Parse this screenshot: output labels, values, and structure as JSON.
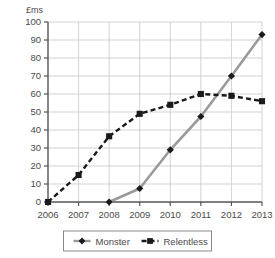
{
  "chart_data": {
    "type": "line",
    "title": "",
    "subtitle": "",
    "xlabel": "",
    "ylabel": "£ms",
    "ylabel_position": "top-left",
    "categories": [
      "2006",
      "2007",
      "2008",
      "2009",
      "2010",
      "2011",
      "2012",
      "2013"
    ],
    "x": [
      2006,
      2007,
      2008,
      2009,
      2010,
      2011,
      2012,
      2013
    ],
    "xlim": [
      2006,
      2013
    ],
    "ylim": [
      0,
      100
    ],
    "ytick_step": 10,
    "yticks": [
      0,
      10,
      20,
      30,
      40,
      50,
      60,
      70,
      80,
      90,
      100
    ],
    "ytick_labels": [
      "0",
      "10",
      "20",
      "30",
      "40",
      "50",
      "60",
      "70",
      "80",
      "90",
      "100"
    ],
    "grid": {
      "horizontal": true,
      "vertical": true,
      "color": "#c8c8c8"
    },
    "legend": {
      "position": "bottom",
      "boxed": true
    },
    "series": [
      {
        "name": "Monster",
        "marker": "diamond",
        "line_style": "solid",
        "color": "#9a9a9a",
        "marker_color": "#1a1a1a",
        "x": [
          2008,
          2009,
          2010,
          2011,
          2012,
          2013
        ],
        "values": [
          0,
          7.5,
          29,
          47.5,
          70,
          93
        ]
      },
      {
        "name": "Relentless",
        "marker": "square",
        "line_style": "dashed",
        "color": "#1a1a1a",
        "marker_color": "#1a1a1a",
        "x": [
          2006,
          2007,
          2008,
          2009,
          2010,
          2011,
          2012,
          2013
        ],
        "values": [
          0,
          15,
          36.5,
          49,
          54,
          60,
          59,
          56
        ]
      }
    ]
  },
  "legend_items": [
    {
      "label": "Monster",
      "marker": "diamond-marker-icon"
    },
    {
      "label": "Relentless",
      "marker": "square-marker-icon"
    }
  ]
}
